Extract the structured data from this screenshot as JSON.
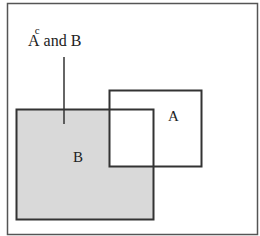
{
  "diagram": {
    "title_label": {
      "base": "A",
      "superscript": "c",
      "rest": " and B"
    },
    "sets": [
      {
        "id": "A",
        "label": "A"
      },
      {
        "id": "B",
        "label": "B"
      }
    ],
    "shaded_region": "A^c and B",
    "colors": {
      "frame": "#555555",
      "outline": "#333333",
      "shade": "#d9d9d9",
      "background": "#ffffff"
    }
  }
}
